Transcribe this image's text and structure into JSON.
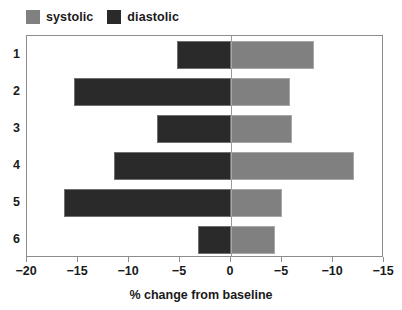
{
  "chart_data": {
    "type": "bar",
    "orientation": "horizontal",
    "title": "",
    "subtitle": "",
    "xlabel": "% change from baseline",
    "ylabel": "",
    "categories": [
      "1",
      "2",
      "3",
      "4",
      "5",
      "6"
    ],
    "series": [
      {
        "name": "systolic",
        "color": "#808080",
        "values": [
          8.1,
          5.8,
          6.0,
          12.1,
          5.0,
          4.3
        ]
      },
      {
        "name": "diastolic",
        "color": "#2a2a2a",
        "values": [
          -5.3,
          -15.4,
          -7.3,
          -11.5,
          -16.4,
          -3.2
        ]
      }
    ],
    "legend": {
      "position": "top-left",
      "entries": [
        {
          "label": "systolic",
          "color": "#808080"
        },
        {
          "label": "diastolic",
          "color": "#2a2a2a"
        }
      ]
    },
    "xaxis": {
      "ticks": [
        -20,
        -15,
        -10,
        -5,
        0,
        5,
        10,
        15
      ],
      "tick_labels": [
        "−20",
        "−15",
        "−10",
        "−5",
        "0",
        "−5",
        "−10",
        "−15"
      ],
      "xlim": [
        -20,
        15
      ],
      "zero_at": 0
    },
    "yaxis": {
      "tick_labels": [
        "1",
        "2",
        "3",
        "4",
        "5",
        "6"
      ]
    },
    "grid": false,
    "frame": true
  }
}
